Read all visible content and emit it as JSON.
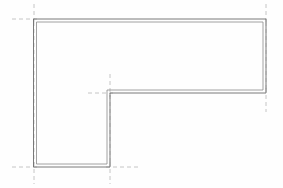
{
  "drawing": {
    "type": "architectural-floor-plan",
    "title": "L-shaped building footprint outline",
    "canvas": {
      "width": 283,
      "height": 188
    },
    "background_color": "#fefefe",
    "wall_color": "#6b6b6b",
    "wall_inner_color": "#8a8a8a",
    "grid_color": "#b8b8b8",
    "wall_thickness_px": 3,
    "outline_shape": "L-shape",
    "vertices": [
      {
        "name": "top-left",
        "x": 34,
        "y": 19
      },
      {
        "name": "top-right",
        "x": 266,
        "y": 19
      },
      {
        "name": "mid-right",
        "x": 266,
        "y": 93
      },
      {
        "name": "inner-corner",
        "x": 110,
        "y": 93
      },
      {
        "name": "bottom-mid",
        "x": 110,
        "y": 167
      },
      {
        "name": "bottom-left",
        "x": 34,
        "y": 167
      }
    ],
    "outer_path": "M34,19 L266,19 L266,93 L110,93 L110,167 L34,167 Z",
    "inner_path": "M37,22 L263,22 L263,90 L107,90 L107,164 L37,164 Z",
    "grid_lines": [
      {
        "name": "grid-top-left-vertical",
        "x1": 34,
        "y1": 4,
        "x2": 34,
        "y2": 24
      },
      {
        "name": "grid-top-left-horizontal",
        "x1": 12,
        "y1": 19,
        "x2": 40,
        "y2": 19
      },
      {
        "name": "grid-top-right-vertical",
        "x1": 266,
        "y1": 4,
        "x2": 266,
        "y2": 24
      },
      {
        "name": "grid-mid-right-vertical",
        "x1": 266,
        "y1": 88,
        "x2": 266,
        "y2": 112
      },
      {
        "name": "grid-inner-corner-vertical",
        "x1": 110,
        "y1": 74,
        "x2": 110,
        "y2": 97
      },
      {
        "name": "grid-inner-corner-horizontal",
        "x1": 88,
        "y1": 93,
        "x2": 116,
        "y2": 93
      },
      {
        "name": "grid-bottom-left-vertical",
        "x1": 34,
        "y1": 162,
        "x2": 34,
        "y2": 184
      },
      {
        "name": "grid-bottom-left-horizontal",
        "x1": 12,
        "y1": 167,
        "x2": 40,
        "y2": 167
      },
      {
        "name": "grid-bottom-mid-vertical",
        "x1": 110,
        "y1": 162,
        "x2": 110,
        "y2": 184
      },
      {
        "name": "grid-bottom-mid-horizontal",
        "x1": 106,
        "y1": 167,
        "x2": 140,
        "y2": 167
      }
    ],
    "interior_grid_lines": [
      {
        "name": "grid-inner-wall-vertical-run",
        "x1": 110,
        "y1": 93,
        "x2": 110,
        "y2": 167
      }
    ]
  }
}
